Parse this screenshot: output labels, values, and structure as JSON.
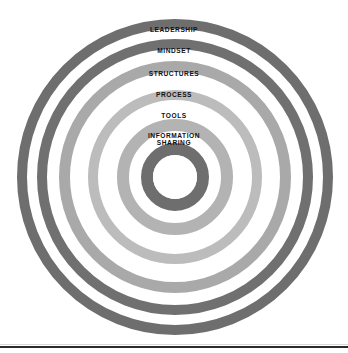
{
  "figure": {
    "background_color": "#ffffff",
    "center": {
      "x": 175,
      "y": 177
    },
    "canvas": {
      "width": 348,
      "height": 353
    }
  },
  "chart_data": {
    "type": "pie",
    "subtype": "concentric-rings",
    "title": "",
    "subtitle": "",
    "xlabel": "",
    "ylabel": "",
    "legend_position": "none",
    "grid": false,
    "center": {
      "x": 175,
      "y": 177
    },
    "categories": [
      "LEADERSHIP",
      "MINDSET",
      "STRUCTURES",
      "PROCESS",
      "TOOLS",
      "INFORMATION\nSHARING"
    ],
    "rings": [
      {
        "index": 1,
        "label": "LEADERSHIP",
        "outer_radius": 158,
        "inner_radius": 148,
        "thickness": 10,
        "color": "#6e6e6e",
        "label_y": 27,
        "font_size": 6.6
      },
      {
        "index": 2,
        "label": "MINDSET",
        "outer_radius": 138,
        "inner_radius": 128,
        "thickness": 10,
        "color": "#707070",
        "label_y": 48,
        "font_size": 6.6
      },
      {
        "index": 3,
        "label": "STRUCTURES",
        "outer_radius": 116,
        "inner_radius": 105,
        "thickness": 11,
        "color": "#a9a9a9",
        "label_y": 71,
        "font_size": 6.6
      },
      {
        "index": 4,
        "label": "PROCESS",
        "outer_radius": 87,
        "inner_radius": 77,
        "thickness": 10,
        "color": "#bcbcbc",
        "label_y": 92,
        "font_size": 6.6
      },
      {
        "index": 5,
        "label": "TOOLS",
        "outer_radius": 58,
        "inner_radius": 46,
        "thickness": 12,
        "color": "#b3b3b3",
        "label_y": 113,
        "font_size": 6.6
      },
      {
        "index": 6,
        "label": "INFORMATION\nSHARING",
        "outer_radius": 34,
        "inner_radius": 22,
        "thickness": 12,
        "color": "#6e6e6e",
        "label_y": 133,
        "font_size": 6.6
      }
    ],
    "core": {
      "label": "",
      "radius": 22,
      "color": "#ffffff"
    },
    "annotations": [
      {
        "name": "bottom-rule",
        "y": 346,
        "color": "#2b2b2b",
        "thickness": 2
      }
    ]
  },
  "footer": {
    "rule_color": "#2b2b2b"
  }
}
